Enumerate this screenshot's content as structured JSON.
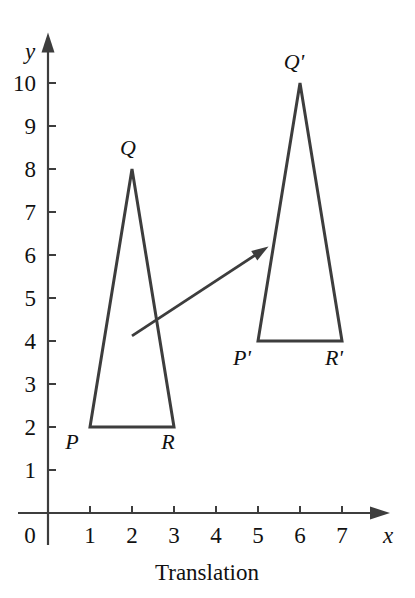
{
  "figure": {
    "caption": "Translation",
    "axes": {
      "x_label": "x",
      "y_label": "y",
      "origin_label": "0",
      "x_ticks": [
        1,
        2,
        3,
        4,
        5,
        6,
        7
      ],
      "y_ticks": [
        1,
        2,
        3,
        4,
        5,
        6,
        7,
        8,
        9,
        10
      ],
      "x_range": [
        0,
        8
      ],
      "y_range": [
        0,
        10.8
      ]
    },
    "line_color": "#3d3d3d",
    "axis_color": "#3d3d3d",
    "text_color": "#111111"
  },
  "chart_data": {
    "type": "scatter",
    "title": "Translation",
    "xlabel": "x",
    "ylabel": "y",
    "xlim": [
      0,
      8
    ],
    "ylim": [
      0,
      10.8
    ],
    "grid": false,
    "legend": "none",
    "shapes": [
      {
        "name": "triangle-pqr",
        "kind": "polygon",
        "closed": true,
        "vertices": [
          {
            "label": "P",
            "x": 1,
            "y": 2
          },
          {
            "label": "Q",
            "x": 2,
            "y": 8
          },
          {
            "label": "R",
            "x": 3,
            "y": 2
          }
        ],
        "vertex_label_offsets": [
          {
            "label": "P",
            "dx": -18,
            "dy": 22
          },
          {
            "label": "Q",
            "dx": -4,
            "dy": -14
          },
          {
            "label": "R",
            "dx": -6,
            "dy": 22
          }
        ]
      },
      {
        "name": "triangle-pqr-prime",
        "kind": "polygon",
        "closed": true,
        "vertices": [
          {
            "label": "P'",
            "x": 5,
            "y": 4
          },
          {
            "label": "Q'",
            "x": 6,
            "y": 10
          },
          {
            "label": "R'",
            "x": 7,
            "y": 4
          }
        ],
        "vertex_label_offsets": [
          {
            "label": "P'",
            "dx": -16,
            "dy": 24
          },
          {
            "label": "Q'",
            "dx": -6,
            "dy": -14
          },
          {
            "label": "R'",
            "dx": -8,
            "dy": 24
          }
        ]
      }
    ],
    "annotations": [
      {
        "name": "translation-vector",
        "kind": "arrow",
        "from": {
          "x": 2.0,
          "y": 4.12
        },
        "to": {
          "x": 5.25,
          "y": 6.2
        }
      }
    ]
  }
}
